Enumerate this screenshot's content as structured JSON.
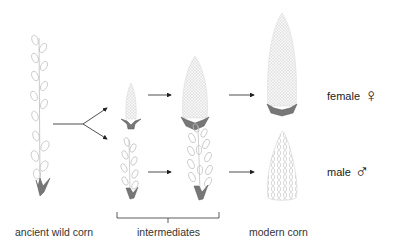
{
  "diagram": {
    "stages": [
      {
        "id": "ancient",
        "label": "ancient wild corn"
      },
      {
        "id": "intermediates",
        "label": "intermediates"
      },
      {
        "id": "modern",
        "label": "modern corn"
      }
    ],
    "rows": [
      {
        "id": "female",
        "label": "female",
        "symbol": "♀"
      },
      {
        "id": "male",
        "label": "male",
        "symbol": "♂"
      }
    ],
    "colors": {
      "line": "#222222",
      "plant_stroke": "#b5b5b5",
      "husk": "#6e6e6e",
      "text": "#333333"
    }
  }
}
